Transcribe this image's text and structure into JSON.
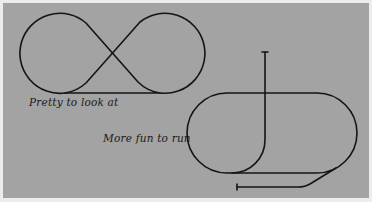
{
  "diagram": {
    "background_color": "#a3a3a3",
    "track_color": "#151515",
    "layouts": [
      {
        "id": "figure-eight",
        "caption": "Pretty to look at",
        "shape": "figure-eight loop with bottom straight"
      },
      {
        "id": "oval-with-spurs",
        "caption": "More fun to run",
        "shape": "oval with vertical branch spur and lower siding"
      }
    ]
  }
}
